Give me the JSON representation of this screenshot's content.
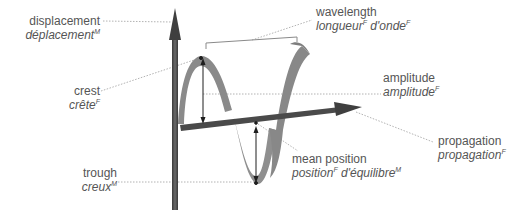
{
  "diagram": {
    "title": "wave",
    "colors": {
      "axis": "#4d4d4d",
      "ribbon": "#8c8c8c",
      "leader": "#9a9a9a",
      "text": "#555555",
      "bracket": "#8a8a8a"
    },
    "labels": {
      "displacement": {
        "en": "displacement",
        "fr": "déplacement",
        "fr_gender": "M"
      },
      "wavelength": {
        "en": "wavelength",
        "fr_1": "longueur",
        "fr_1_gender": "F",
        "fr_2": "d'onde",
        "fr_2_gender": "F"
      },
      "crest": {
        "en": "crest",
        "fr": "crête",
        "fr_gender": "F"
      },
      "amplitude": {
        "en": "amplitude",
        "fr": "amplitude",
        "fr_gender": "F"
      },
      "propagation": {
        "en": "propagation",
        "fr": "propagation",
        "fr_gender": "F"
      },
      "trough": {
        "en": "trough",
        "fr": "creux",
        "fr_gender": "M"
      },
      "mean_position": {
        "en": "mean position",
        "fr_1": "position",
        "fr_1_gender": "F",
        "fr_2": "d'équilibre",
        "fr_2_gender": "M"
      }
    }
  }
}
